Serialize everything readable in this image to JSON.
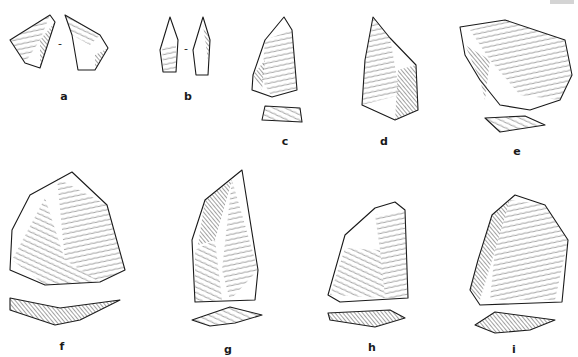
{
  "figure": {
    "type": "illustration-plate",
    "artifacts": [
      {
        "label": "a",
        "views": 2
      },
      {
        "label": "b",
        "views": 2
      },
      {
        "label": "c",
        "views": 2
      },
      {
        "label": "d",
        "views": 1
      },
      {
        "label": "e",
        "views": 2
      },
      {
        "label": "f",
        "views": 2
      },
      {
        "label": "g",
        "views": 2
      },
      {
        "label": "h",
        "views": 2
      },
      {
        "label": "i",
        "views": 2
      }
    ],
    "separator": "-"
  }
}
